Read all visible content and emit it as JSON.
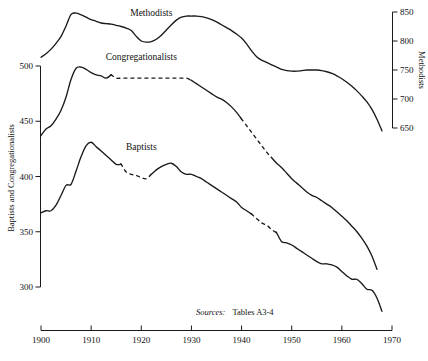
{
  "chart_data": {
    "type": "line",
    "title": "",
    "xlabel": "",
    "ylabel": "Baptists and Congregationalists",
    "y2label": "Methodists",
    "xlim": [
      1900,
      1970
    ],
    "ylim": [
      300,
      500
    ],
    "y2lim": [
      650,
      850
    ],
    "grid": false,
    "legend_position": "inline-labels",
    "x_ticks": [
      "1900",
      "1910",
      "1920",
      "1930",
      "1940",
      "1950",
      "1960",
      "1970"
    ],
    "x_tick_values": [
      1900,
      1910,
      1920,
      1930,
      1940,
      1950,
      1960,
      1970
    ],
    "y_ticks": [
      "300",
      "350",
      "400",
      "450",
      "500"
    ],
    "y_tick_values": [
      300,
      350,
      400,
      450,
      500
    ],
    "y2_ticks": [
      "650",
      "700",
      "750",
      "800",
      "850"
    ],
    "y2_tick_values": [
      650,
      700,
      750,
      800,
      850
    ],
    "annotations": [
      {
        "name": "source-note",
        "text_italic": "Sources:",
        "text": "Tables A3-4",
        "x": 1930,
        "y_px": 312
      }
    ],
    "series": [
      {
        "name": "Methodists",
        "axis": "right",
        "label": "Methodists",
        "label_x": 1922,
        "label_y": 843,
        "style": "solid",
        "x": [
          1900,
          1901,
          1902,
          1903,
          1904,
          1905,
          1906,
          1907,
          1908,
          1909,
          1910,
          1911,
          1912,
          1913,
          1914,
          1915,
          1916,
          1917,
          1918,
          1919,
          1920,
          1921,
          1922,
          1923,
          1924,
          1925,
          1926,
          1927,
          1928,
          1929,
          1930,
          1931,
          1932,
          1933,
          1934,
          1935,
          1936,
          1937,
          1938,
          1939,
          1940,
          1941,
          1942,
          1943,
          1944,
          1945,
          1946,
          1947,
          1948,
          1949,
          1950,
          1951,
          1952,
          1953,
          1954,
          1955,
          1956,
          1957,
          1958,
          1959,
          1960,
          1961,
          1962,
          1963,
          1964,
          1965,
          1966,
          1967,
          1968
        ],
        "y": [
          772,
          778,
          786,
          796,
          808,
          826,
          846,
          848,
          845,
          841,
          837,
          834,
          831,
          830,
          829,
          827,
          825,
          822,
          818,
          808,
          800,
          798,
          799,
          803,
          810,
          819,
          828,
          836,
          841,
          843,
          843,
          843,
          842,
          840,
          837,
          833,
          828,
          823,
          818,
          812,
          805,
          795,
          783,
          773,
          767,
          763,
          759,
          755,
          751,
          749,
          748,
          748,
          749,
          750,
          750,
          750,
          749,
          747,
          744,
          740,
          735,
          729,
          722,
          714,
          705,
          695,
          682,
          665,
          645
        ]
      },
      {
        "name": "Congregationalists",
        "axis": "left",
        "label": "Congregationalists",
        "label_x": 1920,
        "label_y": 505,
        "style": "mixed",
        "dashed_ranges": [
          [
            1914,
            1929
          ],
          [
            1940,
            1945
          ]
        ],
        "x": [
          1900,
          1901,
          1902,
          1903,
          1904,
          1905,
          1906,
          1907,
          1908,
          1909,
          1910,
          1911,
          1912,
          1913,
          1914,
          1915,
          1916,
          1917,
          1918,
          1919,
          1920,
          1921,
          1922,
          1923,
          1924,
          1925,
          1926,
          1927,
          1928,
          1929,
          1930,
          1931,
          1932,
          1933,
          1934,
          1935,
          1936,
          1937,
          1938,
          1939,
          1940,
          1941,
          1942,
          1943,
          1944,
          1945,
          1946,
          1947,
          1948,
          1949,
          1950,
          1951,
          1952,
          1953,
          1954,
          1955,
          1956,
          1957,
          1958,
          1959,
          1960,
          1961,
          1962,
          1963,
          1964,
          1965,
          1966,
          1967
        ],
        "y": [
          437,
          443,
          446,
          452,
          460,
          472,
          488,
          498,
          499,
          497,
          494,
          492,
          491,
          489,
          492,
          489,
          489,
          489,
          489,
          489,
          489,
          489,
          489,
          489,
          489,
          489,
          489,
          489,
          489,
          489,
          487,
          484,
          481,
          478,
          475,
          472,
          470,
          467,
          463,
          458,
          452,
          446,
          440,
          434,
          428,
          422,
          417,
          412,
          408,
          403,
          398,
          394,
          390,
          386,
          383,
          381,
          378,
          375,
          372,
          368,
          364,
          360,
          355,
          350,
          344,
          337,
          328,
          316
        ]
      },
      {
        "name": "Baptists",
        "axis": "left",
        "label": "Baptists",
        "label_x": 1920,
        "label_y": 424,
        "style": "mixed",
        "dashed_ranges": [
          [
            1916,
            1921
          ],
          [
            1942,
            1946
          ]
        ],
        "x": [
          1900,
          1901,
          1902,
          1903,
          1904,
          1905,
          1906,
          1907,
          1908,
          1909,
          1910,
          1911,
          1912,
          1913,
          1914,
          1915,
          1916,
          1917,
          1918,
          1919,
          1920,
          1921,
          1922,
          1923,
          1924,
          1925,
          1926,
          1927,
          1928,
          1929,
          1930,
          1931,
          1932,
          1933,
          1934,
          1935,
          1936,
          1937,
          1938,
          1939,
          1940,
          1941,
          1942,
          1943,
          1944,
          1945,
          1946,
          1947,
          1948,
          1949,
          1950,
          1951,
          1952,
          1953,
          1954,
          1955,
          1956,
          1957,
          1958,
          1959,
          1960,
          1961,
          1962,
          1963,
          1964,
          1965,
          1966,
          1967,
          1968
        ],
        "y": [
          367,
          369,
          369,
          374,
          383,
          392,
          393,
          405,
          418,
          428,
          431,
          427,
          423,
          419,
          415,
          411,
          411,
          404,
          402,
          401,
          399,
          398,
          402,
          406,
          409,
          411,
          412,
          409,
          404,
          402,
          402,
          400,
          398,
          395,
          392,
          389,
          386,
          383,
          380,
          377,
          372,
          369,
          366,
          362,
          358,
          356,
          352,
          349,
          341,
          340,
          338,
          335,
          332,
          329,
          326,
          323,
          321,
          321,
          320,
          318,
          314,
          310,
          307,
          307,
          303,
          298,
          297,
          290,
          278
        ]
      }
    ]
  },
  "labels": {
    "y_axis_title": "Baptists and Congregationalists",
    "y2_axis_title": "Methodists",
    "source_prefix": "Sources:",
    "source_body": "Tables A3-4",
    "series_methodists": "Methodists",
    "series_congregationalists": "Congregationalists",
    "series_baptists": "Baptists"
  },
  "colors": {
    "ink": "#1a1a1a",
    "background": "#ffffff"
  }
}
